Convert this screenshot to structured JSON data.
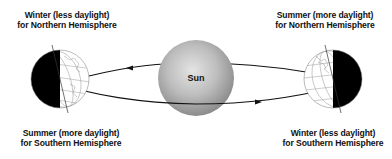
{
  "diagram": {
    "labels": {
      "top_left": {
        "line1": "Winter (less daylight)",
        "line2": "for Northern Hemisphere"
      },
      "top_right": {
        "line1": "Summer (more daylight)",
        "line2": "for Northern Hemisphere"
      },
      "bottom_left": {
        "line1": "Summer (more daylight)",
        "line2": "for Southern Hemisphere"
      },
      "bottom_right": {
        "line1": "Winter (less daylight)",
        "line2": "for Southern Hemisphere"
      }
    },
    "sun": {
      "label": "Sun"
    },
    "colors": {
      "night_side": "#000000",
      "sun_light": "#e6e6e6",
      "sun_dark": "#8a8a8a",
      "orbit": "#111111",
      "grid": "#9a9a9a"
    }
  }
}
